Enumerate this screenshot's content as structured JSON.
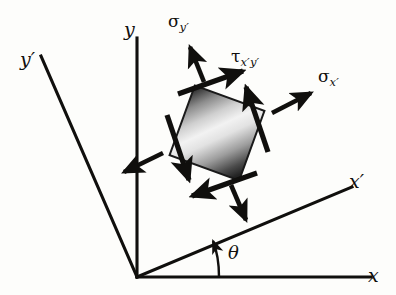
{
  "figure": {
    "background_color": "#fdfdfb",
    "ink_color": "#100f0d",
    "axes": [
      {
        "name": "x",
        "label": "x",
        "kind": "original-horizontal"
      },
      {
        "name": "y",
        "label": "y",
        "kind": "original-vertical"
      },
      {
        "name": "x-prime",
        "label": "x′",
        "kind": "rotated-horizontal"
      },
      {
        "name": "y-prime",
        "label": "y′",
        "kind": "rotated-vertical"
      }
    ],
    "angle": {
      "label": "θ",
      "symbol": "θ",
      "between": [
        "x",
        "x-prime"
      ]
    },
    "stresses": [
      {
        "name": "sigma-x-prime",
        "symbol": "σ",
        "subscript": "x′",
        "direction": "outward-right",
        "kind": "normal"
      },
      {
        "name": "sigma-y-prime",
        "symbol": "σ",
        "subscript": "y′",
        "direction": "outward-up",
        "kind": "normal"
      },
      {
        "name": "tau-x-prime-y-prime",
        "symbol": "τ",
        "subscript": "x′y′",
        "direction": "along-edges",
        "kind": "shear"
      }
    ],
    "element": {
      "name": "stress-element",
      "shape": "square",
      "rotation_deg": 20,
      "fill": "gradient",
      "gradient_from": "#2b2b2b",
      "gradient_mid": "#f4f4f4",
      "gradient_to": "#1f1f1f"
    }
  }
}
